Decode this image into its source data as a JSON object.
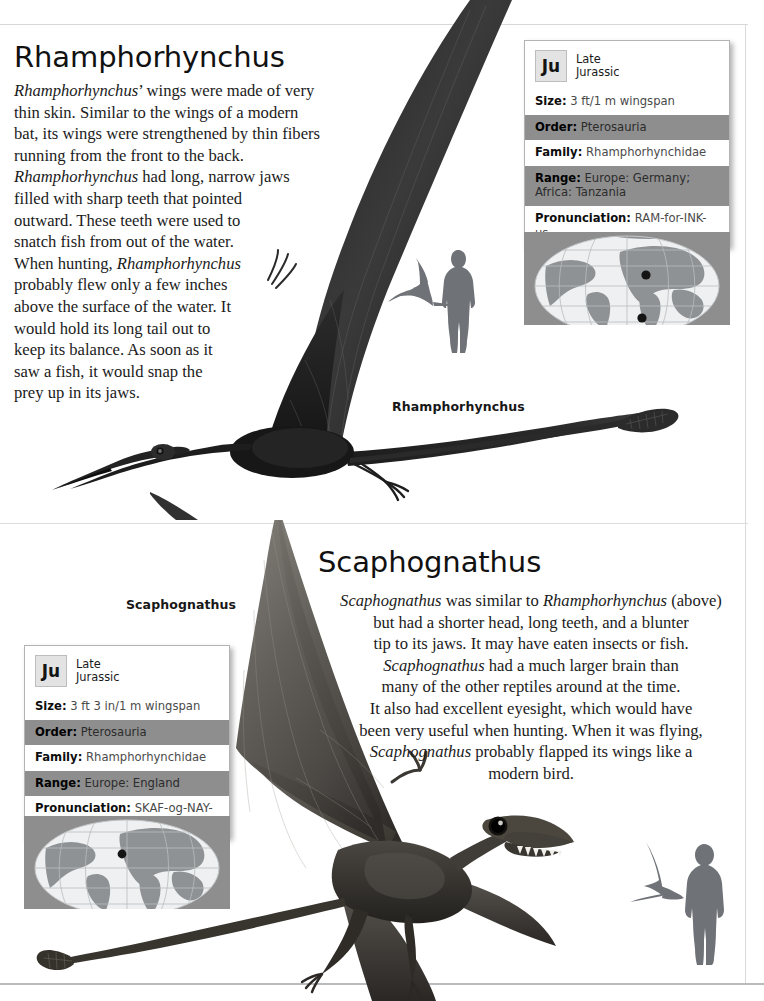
{
  "page": {
    "background_color": "#ffffff",
    "rule_color": "#d8d8d8",
    "bottom_rule_color": "#b9bcbe"
  },
  "sections": [
    {
      "id": "rhamphorhynchus",
      "heading": "Rhamphorhynchus",
      "body_lines": [
        "<i>Rhamphorhynchus</i>’ wings were made of very",
        "thin skin. Similar to the wings of a modern",
        "bat, its wings were strengthened by thin fibers",
        "running from the front to the back.",
        "<i>Rhamphorhynchus</i> had long, narrow jaws",
        "filled with sharp teeth that pointed",
        "outward. These teeth were used to",
        "snatch fish from out of the water.",
        "When hunting, <i>Rhamphorhynchus</i>",
        "probably flew only a few inches",
        "above the surface of the water. It",
        "would hold its long tail out to",
        "keep its balance. As soon as it",
        "saw a fish, it would snap the",
        "prey up in its jaws."
      ],
      "scale_caption": "Rhamphorhynchus",
      "artwork_caption": null,
      "infobox": {
        "badge": "Ju",
        "period_line1": "Late",
        "period_line2": "Jurassic",
        "rows": [
          {
            "label": "Size:",
            "value": "3 ft/1 m wingspan",
            "band": "white"
          },
          {
            "label": "Order:",
            "value": "Pterosauria",
            "band": "gray"
          },
          {
            "label": "Family:",
            "value": "Rhamphorhynchidae",
            "band": "white"
          },
          {
            "label": "Range:",
            "value": "Europe: Germany; Africa: Tanzania",
            "band": "gray"
          },
          {
            "label": "Pronunciation:",
            "value": "RAM-for-INK-us",
            "band": "white"
          }
        ]
      },
      "globe": {
        "markers": [
          "Germany",
          "Tanzania"
        ],
        "marker_count": 2
      }
    },
    {
      "id": "scaphognathus",
      "heading": "Scaphognathus",
      "body_lines": [
        "<i>Scaphognathus</i> was similar to <i>Rhamphorhynchus</i> (above)",
        "but had a shorter head, long teeth, and a blunter",
        "tip to its jaws. It may have eaten insects or fish.",
        "<i>Scaphognathus</i> had a much larger brain than",
        "many of the other reptiles around at the time.",
        "It also had excellent eyesight, which would have",
        "been very useful when hunting. When it was flying,",
        "<i>Scaphognathus</i> probably flapped its wings like a",
        "modern bird."
      ],
      "artwork_caption": "Scaphognathus",
      "scale_caption": null,
      "infobox": {
        "badge": "Ju",
        "period_line1": "Late",
        "period_line2": "Jurassic",
        "rows": [
          {
            "label": "Size:",
            "value": "3 ft 3 in/1 m wingspan",
            "band": "white"
          },
          {
            "label": "Order:",
            "value": "Pterosauria",
            "band": "gray"
          },
          {
            "label": "Family:",
            "value": "Rhamphorhynchidae",
            "band": "white"
          },
          {
            "label": "Range:",
            "value": "Europe: England",
            "band": "gray"
          },
          {
            "label": "Pronunciation:",
            "value": "SKAF-og-NAY-thus",
            "band": "white"
          }
        ]
      },
      "globe": {
        "markers": [
          "England"
        ],
        "marker_count": 1
      }
    }
  ],
  "colors": {
    "infobox_band_gray": "#8e8e8e",
    "infobox_border": "#b3b3b3",
    "badge_fill": "#e3e3e3",
    "silhouette": "#6f7277",
    "globe_land": "#8f9295",
    "globe_sea": "#eef0f1"
  }
}
